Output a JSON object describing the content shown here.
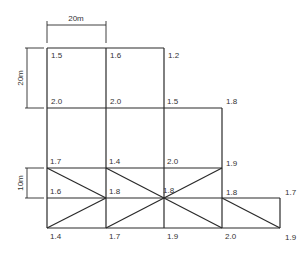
{
  "diagram": {
    "type": "survey-grid",
    "line_color": "#2a2a2a",
    "text_color": "#333333",
    "dimensions": {
      "horizontal": {
        "label": "20m",
        "x1": 47,
        "x2": 106,
        "y": 25
      },
      "vertical_large": {
        "label": "20m",
        "x": 27,
        "y1": 48,
        "y2": 108
      },
      "vertical_small": {
        "label": "10m",
        "x": 27,
        "y1": 168,
        "y2": 198
      }
    },
    "nodes": [
      {
        "id": "n1",
        "x": 47,
        "y": 48,
        "value": "1.5",
        "lx": 51,
        "ly": 58
      },
      {
        "id": "n2",
        "x": 106,
        "y": 48,
        "value": "1.6",
        "lx": 110,
        "ly": 58
      },
      {
        "id": "n3",
        "x": 164,
        "y": 48,
        "value": "1.2",
        "lx": 168,
        "ly": 58
      },
      {
        "id": "n4",
        "x": 47,
        "y": 108,
        "value": "2.0",
        "lx": 51,
        "ly": 104
      },
      {
        "id": "n5",
        "x": 106,
        "y": 108,
        "value": "2.0",
        "lx": 110,
        "ly": 104
      },
      {
        "id": "n6",
        "x": 164,
        "y": 108,
        "value": "1.5",
        "lx": 167,
        "ly": 104
      },
      {
        "id": "n7",
        "x": 222,
        "y": 108,
        "value": "1.8",
        "lx": 226,
        "ly": 104
      },
      {
        "id": "n8",
        "x": 47,
        "y": 168,
        "value": "1.7",
        "lx": 50,
        "ly": 164
      },
      {
        "id": "n9",
        "x": 106,
        "y": 168,
        "value": "1.4",
        "lx": 109,
        "ly": 164
      },
      {
        "id": "n10",
        "x": 164,
        "y": 168,
        "value": "2.0",
        "lx": 167,
        "ly": 164
      },
      {
        "id": "n11",
        "x": 222,
        "y": 168,
        "value": "1.9",
        "lx": 226,
        "ly": 166
      },
      {
        "id": "n12",
        "x": 47,
        "y": 198,
        "value": "1.6",
        "lx": 50,
        "ly": 194
      },
      {
        "id": "n13",
        "x": 106,
        "y": 198,
        "value": "1.8",
        "lx": 109,
        "ly": 194
      },
      {
        "id": "n14",
        "x": 164,
        "y": 198,
        "value": "1.8",
        "lx": 163,
        "ly": 193
      },
      {
        "id": "n15",
        "x": 222,
        "y": 198,
        "value": "1.8",
        "lx": 226,
        "ly": 195
      },
      {
        "id": "n16",
        "x": 280,
        "y": 198,
        "value": "1.7",
        "lx": 285,
        "ly": 195
      },
      {
        "id": "n17",
        "x": 47,
        "y": 228,
        "value": "1.4",
        "lx": 50,
        "ly": 239
      },
      {
        "id": "n18",
        "x": 106,
        "y": 228,
        "value": "1.7",
        "lx": 109,
        "ly": 239
      },
      {
        "id": "n19",
        "x": 164,
        "y": 228,
        "value": "1.9",
        "lx": 167,
        "ly": 239
      },
      {
        "id": "n20",
        "x": 222,
        "y": 228,
        "value": "2.0",
        "lx": 225,
        "ly": 239
      },
      {
        "id": "n21",
        "x": 280,
        "y": 228,
        "value": "1.9",
        "lx": 285,
        "ly": 240
      }
    ],
    "lines": [
      [
        47,
        48,
        164,
        48
      ],
      [
        47,
        108,
        222,
        108
      ],
      [
        47,
        168,
        222,
        168
      ],
      [
        47,
        198,
        280,
        198
      ],
      [
        47,
        228,
        280,
        228
      ],
      [
        47,
        48,
        47,
        228
      ],
      [
        106,
        48,
        106,
        228
      ],
      [
        164,
        48,
        164,
        228
      ],
      [
        222,
        108,
        222,
        228
      ],
      [
        280,
        198,
        280,
        228
      ],
      [
        47,
        168,
        106,
        198
      ],
      [
        47,
        228,
        106,
        198
      ],
      [
        106,
        168,
        164,
        198
      ],
      [
        222,
        168,
        164,
        198
      ],
      [
        106,
        228,
        164,
        198
      ],
      [
        222,
        228,
        164,
        198
      ],
      [
        222,
        198,
        280,
        228
      ]
    ]
  }
}
